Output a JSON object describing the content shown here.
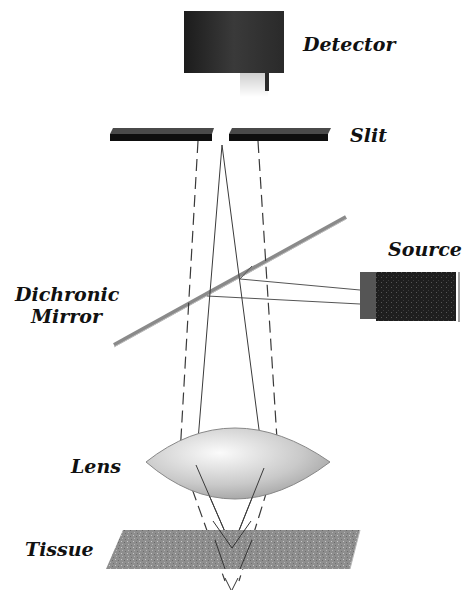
{
  "diagram": {
    "type": "confocal microscope optical path",
    "labels": {
      "detector": "Detector",
      "slit": "Slit",
      "source": "Source",
      "dichronic_line1": "Dichronic",
      "dichronic_line2": "Mirror",
      "lens": "Lens",
      "tissue": "Tissue"
    },
    "components": [
      "Detector",
      "Slit",
      "Dichronic Mirror",
      "Source",
      "Lens",
      "Tissue"
    ],
    "colors": {
      "detector": "#2b2b2b",
      "slit": "#111111",
      "mirror": "#8a8a8a",
      "source": "#1e1e1e",
      "lens": "#d8d8d8",
      "tissue": "#8c8c8c",
      "rays": "#444444"
    }
  }
}
